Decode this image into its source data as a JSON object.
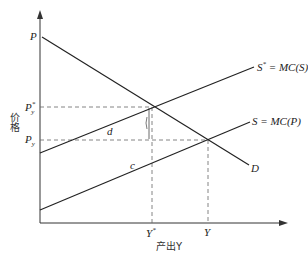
{
  "diagram": {
    "type": "supply-demand-externality",
    "y_axis_label": "价格",
    "x_axis_label": "产出Y",
    "price_intercept_label": "P",
    "price_social_label": "P",
    "price_social_sub": "y",
    "price_social_sup": "*",
    "price_private_label": "P",
    "price_private_sub": "y",
    "output_social_label": "Y",
    "output_social_sup": "*",
    "output_private_label": "Y",
    "social_supply_label": "S",
    "social_supply_sup": "*",
    "social_supply_eq": " = MC(S)",
    "private_supply_label": "S = MC(P)",
    "demand_label": "D",
    "area_d_label": "d",
    "area_c_label": "c",
    "colors": {
      "line": "#222222",
      "dashed": "#555555"
    }
  }
}
